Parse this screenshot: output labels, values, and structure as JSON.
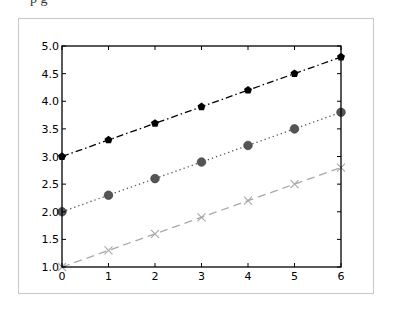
{
  "header": {
    "clipped_text": "p  g"
  },
  "chart_data": {
    "type": "line",
    "title": "",
    "xlabel": "",
    "ylabel": "",
    "x": [
      0,
      1,
      2,
      3,
      4,
      5,
      6
    ],
    "xlim": [
      0,
      6
    ],
    "ylim": [
      1.0,
      5.0
    ],
    "xticks": [
      0,
      1,
      2,
      3,
      4,
      5,
      6
    ],
    "xtick_labels": [
      "0",
      "1",
      "2",
      "3",
      "4",
      "5",
      "6"
    ],
    "yticks": [
      1.0,
      1.5,
      2.0,
      2.5,
      3.0,
      3.5,
      4.0,
      4.5,
      5.0
    ],
    "ytick_labels": [
      "1.0",
      "1.5",
      "2.0",
      "2.5",
      "3.0",
      "3.5",
      "4.0",
      "4.5",
      "5.0"
    ],
    "grid": false,
    "legend": null,
    "series": [
      {
        "name": "series-1",
        "values": [
          3.0,
          3.3,
          3.6,
          3.9,
          4.2,
          4.5,
          4.8
        ],
        "color": "#000000",
        "linestyle": "dashdot",
        "marker": "pentagon"
      },
      {
        "name": "series-2",
        "values": [
          2.0,
          2.3,
          2.6,
          2.9,
          3.2,
          3.5,
          3.8
        ],
        "color": "#555555",
        "linestyle": "dotted",
        "marker": "circle"
      },
      {
        "name": "series-3",
        "values": [
          1.0,
          1.3,
          1.6,
          1.9,
          2.2,
          2.5,
          2.8
        ],
        "color": "#a8a8a8",
        "linestyle": "dashed",
        "marker": "x"
      }
    ]
  }
}
